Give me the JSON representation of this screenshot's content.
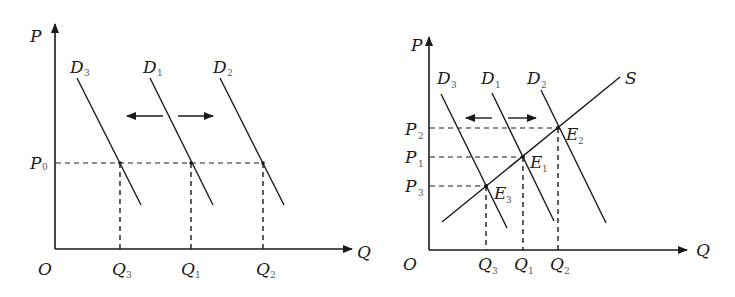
{
  "left_diagram": {
    "axes": {
      "y_label": "P",
      "x_label": "Q",
      "origin_label": "O"
    },
    "price_level": {
      "label": "P",
      "sub": "0"
    },
    "demand_curves": [
      {
        "label": "D",
        "sub": "3"
      },
      {
        "label": "D",
        "sub": "1"
      },
      {
        "label": "D",
        "sub": "2"
      }
    ],
    "quantities": [
      {
        "label": "Q",
        "sub": "3"
      },
      {
        "label": "Q",
        "sub": "1"
      },
      {
        "label": "Q",
        "sub": "2"
      }
    ],
    "shift_arrows": [
      "left",
      "right"
    ]
  },
  "right_diagram": {
    "axes": {
      "y_label": "P",
      "x_label": "Q",
      "origin_label": "O"
    },
    "supply_curve": {
      "label": "S"
    },
    "demand_curves": [
      {
        "label": "D",
        "sub": "3"
      },
      {
        "label": "D",
        "sub": "1"
      },
      {
        "label": "D",
        "sub": "2"
      }
    ],
    "prices": [
      {
        "label": "P",
        "sub": "2"
      },
      {
        "label": "P",
        "sub": "1"
      },
      {
        "label": "P",
        "sub": "3"
      }
    ],
    "equilibria": [
      {
        "label": "E",
        "sub": "2"
      },
      {
        "label": "E",
        "sub": "1"
      },
      {
        "label": "E",
        "sub": "3"
      }
    ],
    "quantities": [
      {
        "label": "Q",
        "sub": "3"
      },
      {
        "label": "Q",
        "sub": "1"
      },
      {
        "label": "Q",
        "sub": "2"
      }
    ],
    "shift_arrows": [
      "left",
      "right"
    ]
  },
  "colors": {
    "ink": "#1a1a1a",
    "background": "#ffffff"
  }
}
